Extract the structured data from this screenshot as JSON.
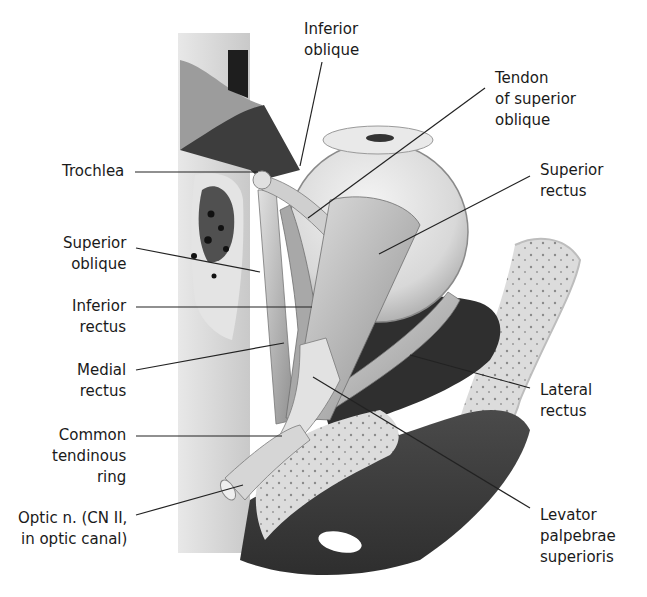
{
  "figure": {
    "colors": {
      "background": "#ffffff",
      "text": "#1a1a1a",
      "leader_line": "#222222",
      "bone": "#d9d9d9",
      "muscle": "#bdbdbd",
      "dark_cavity": "#3a3a3a",
      "eyeball": "#e6e6e6"
    }
  },
  "labels": [
    {
      "id": "inferior-oblique",
      "text": "Inferior\noblique",
      "x": 304,
      "y": 19,
      "align": "left",
      "line": [
        [
          322,
          62
        ],
        [
          300,
          166
        ]
      ]
    },
    {
      "id": "tendon-of-superior-oblique",
      "text": "Tendon\nof superior\noblique",
      "x": 495,
      "y": 68,
      "align": "left",
      "line": [
        [
          485,
          88
        ],
        [
          308,
          218
        ]
      ]
    },
    {
      "id": "trochlea",
      "text": "Trochlea",
      "x": 62,
      "y": 161,
      "align": "right",
      "line": [
        [
          135,
          172
        ],
        [
          258,
          172
        ]
      ]
    },
    {
      "id": "superior-rectus",
      "text": "Superior\nrectus",
      "x": 540,
      "y": 160,
      "align": "left",
      "line": [
        [
          530,
          176
        ],
        [
          379,
          254
        ]
      ]
    },
    {
      "id": "superior-oblique",
      "text": "Superior\noblique",
      "x": 63,
      "y": 233,
      "align": "right",
      "line": [
        [
          136,
          248
        ],
        [
          260,
          272
        ]
      ]
    },
    {
      "id": "inferior-rectus",
      "text": "Inferior\nrectus",
      "x": 72,
      "y": 296,
      "align": "right",
      "line": [
        [
          136,
          307
        ],
        [
          312,
          307
        ]
      ]
    },
    {
      "id": "medial-rectus",
      "text": "Medial\nrectus",
      "x": 77,
      "y": 360,
      "align": "right",
      "line": [
        [
          136,
          370
        ],
        [
          284,
          343
        ]
      ]
    },
    {
      "id": "lateral-rectus",
      "text": "Lateral\nrectus",
      "x": 540,
      "y": 380,
      "align": "left",
      "line": [
        [
          530,
          388
        ],
        [
          410,
          355
        ]
      ]
    },
    {
      "id": "common-tendinous-ring",
      "text": "Common\ntendinous\nring",
      "x": 52,
      "y": 425,
      "align": "right",
      "line": [
        [
          136,
          436
        ],
        [
          282,
          436
        ]
      ]
    },
    {
      "id": "optic-nerve",
      "text": "Optic n. (CN II,\nin optic canal)",
      "x": 18,
      "y": 508,
      "align": "right",
      "line": [
        [
          136,
          515
        ],
        [
          243,
          485
        ]
      ]
    },
    {
      "id": "levator-palpebrae-superioris",
      "text": "Levator\npalpebrae\nsuperioris",
      "x": 540,
      "y": 505,
      "align": "left",
      "line": [
        [
          530,
          508
        ],
        [
          313,
          377
        ]
      ]
    }
  ]
}
